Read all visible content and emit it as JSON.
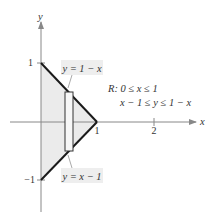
{
  "figure": {
    "axes": {
      "x_label": "x",
      "y_label": "y",
      "x_ticks": [
        {
          "value": 1,
          "label": "1"
        },
        {
          "value": 2,
          "label": "2"
        }
      ],
      "y_ticks": [
        {
          "value": 1,
          "label": "1"
        },
        {
          "value": -1,
          "label": "−1"
        }
      ]
    },
    "region": {
      "name": "R",
      "vertices": [
        [
          0,
          1
        ],
        [
          1,
          0
        ],
        [
          0,
          -1
        ]
      ],
      "fill_color": "#ebebeb",
      "edge_color": "#1a1a1a"
    },
    "curves": {
      "upper": {
        "label": "y = 1 − x"
      },
      "lower": {
        "label": "y = x − 1"
      }
    },
    "region_description": {
      "line1": "R: 0 ≤ x ≤ 1",
      "line2": "x − 1 ≤ y ≤ 1 − x"
    },
    "representative_rectangle": {
      "note": "vertical strip inside region"
    },
    "colors": {
      "axis": "#888888",
      "label_box": "#eeeeee",
      "text": "#333333"
    }
  }
}
